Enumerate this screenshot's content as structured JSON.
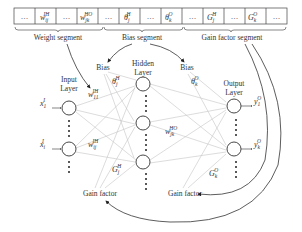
{
  "segment_bar": {
    "cells": [
      {
        "main": "…",
        "sup": ""
      },
      {
        "main": "w",
        "sub": "ij",
        "sup": "IH"
      },
      {
        "main": "…",
        "sup": ""
      },
      {
        "main": "w",
        "sub": "jk",
        "sup": "HO"
      },
      {
        "main": "…",
        "sup": ""
      },
      {
        "main": "θ",
        "sub": "j",
        "sup": "H"
      },
      {
        "main": "…",
        "sup": ""
      },
      {
        "main": "θ",
        "sub": "k",
        "sup": "O"
      },
      {
        "main": "…",
        "sup": ""
      },
      {
        "main": "G",
        "sub": "j",
        "sup": "H"
      },
      {
        "main": "…",
        "sup": ""
      },
      {
        "main": "G",
        "sub": "k",
        "sup": "O"
      },
      {
        "main": "…",
        "sup": ""
      }
    ],
    "segments": {
      "weight": "Weight segment",
      "bias": "Bias segment",
      "gain": "Gain factor segment"
    }
  },
  "layers": {
    "input": {
      "line1": "Input",
      "line2": "Layer"
    },
    "hidden": {
      "line1": "Hidden",
      "line2": "Layer"
    },
    "output": {
      "line1": "Output",
      "line2": "Layer"
    }
  },
  "labels": {
    "bias_hidden": "Bias",
    "bias_output": "Bias",
    "gain_hidden": "Gain factor",
    "gain_output": "Gain factor"
  },
  "symbols": {
    "x1": {
      "main": "x",
      "sub": "1",
      "sup": "I"
    },
    "xi": {
      "main": "x",
      "sub": "i",
      "sup": "I"
    },
    "w11": {
      "main": "w",
      "sub": "11",
      "sup": "IH"
    },
    "wij": {
      "main": "w",
      "sub": "ij",
      "sup": "IH"
    },
    "wjk": {
      "main": "w",
      "sub": "jk",
      "sup": "HO"
    },
    "theta_j": {
      "main": "θ",
      "sub": "j",
      "sup": "H"
    },
    "theta_k": {
      "main": "θ",
      "sub": "k",
      "sup": "O"
    },
    "G_j": {
      "main": "G",
      "sub": "j",
      "sup": "H"
    },
    "G_k": {
      "main": "G",
      "sub": "k",
      "sup": "O"
    },
    "y1": {
      "main": "y",
      "sub": "1",
      "sup": "O"
    },
    "yk": {
      "main": "y",
      "sub": "k",
      "sup": "O"
    }
  }
}
